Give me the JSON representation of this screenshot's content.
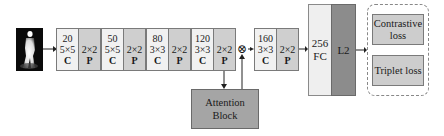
{
  "input": {
    "icon": "person-silhouette-icon"
  },
  "layers": [
    {
      "channels": "20",
      "kernel": "5×5",
      "type": "C"
    },
    {
      "channels": "",
      "kernel": "2×2",
      "type": "P"
    },
    {
      "channels": "50",
      "kernel": "5×5",
      "type": "C"
    },
    {
      "channels": "",
      "kernel": "2×2",
      "type": "P"
    },
    {
      "channels": "80",
      "kernel": "3×3",
      "type": "C"
    },
    {
      "channels": "",
      "kernel": "2×2",
      "type": "P"
    },
    {
      "channels": "120",
      "kernel": "3×3",
      "type": "C"
    },
    {
      "channels": "",
      "kernel": "2×2",
      "type": "P"
    },
    {
      "channels": "160",
      "kernel": "3×3",
      "type": "C"
    },
    {
      "channels": "",
      "kernel": "2×2",
      "type": "P"
    }
  ],
  "multiply_symbol": "⊗",
  "fc": {
    "size": "256",
    "label": "FC"
  },
  "l2": {
    "label": "L2"
  },
  "losses": [
    {
      "label": "Contrastive loss"
    },
    {
      "label": "Triplet loss"
    }
  ],
  "attention": {
    "line1": "Attention",
    "line2": "Block"
  },
  "colors": {
    "conv": "#f1f1f1",
    "pool": "#cfcfcf",
    "fc": "#efefef",
    "l2": "#8c8c8c",
    "loss": "#cdcdcd",
    "attention": "#a5a5a5"
  }
}
